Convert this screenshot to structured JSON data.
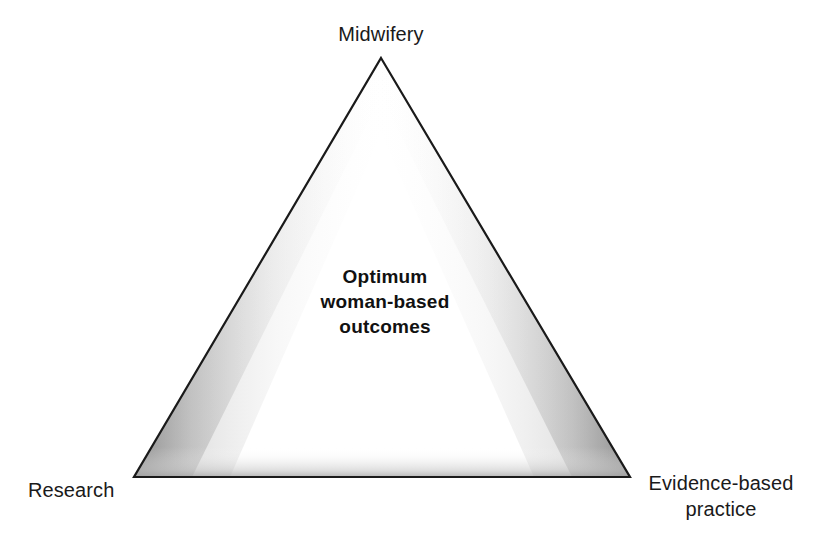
{
  "canvas": {
    "width": 814,
    "height": 542,
    "background_color": "#ffffff"
  },
  "diagram": {
    "type": "triangle-concept-diagram",
    "shape_name": "triangle",
    "stroke_color": "#1a1a1a",
    "stroke_width": 2,
    "inner_shadow_color": "#9a9a9a",
    "fill_color": "#ffffff",
    "vertices": {
      "apex": {
        "x": 381,
        "y": 58
      },
      "bottom_left": {
        "x": 134,
        "y": 477
      },
      "bottom_right": {
        "x": 630,
        "y": 477
      }
    }
  },
  "vertex_labels": {
    "top": "Midwifery",
    "bottom_left": "Research",
    "bottom_right_line1": "Evidence-based",
    "bottom_right_line2": "practice"
  },
  "center_text": {
    "line1": "Optimum",
    "line2": "woman-based",
    "line3": "outcomes"
  }
}
